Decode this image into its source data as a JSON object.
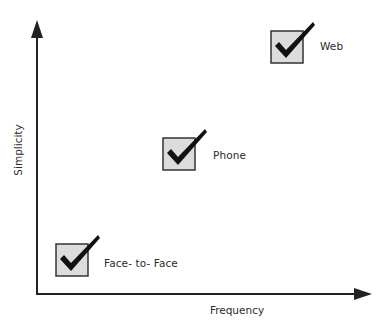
{
  "diagram": {
    "type": "quadrant-scatter",
    "x_axis": {
      "label": "Frequency"
    },
    "y_axis": {
      "label": "Simplicity"
    },
    "colors": {
      "axis": "#222222",
      "box_fill": "#dcdcdc",
      "box_border": "#333333",
      "check": "#111111",
      "text": "#2a2a2a"
    },
    "items": [
      {
        "label": "Face- to- Face",
        "icon": "checkbox-checked-icon"
      },
      {
        "label": "Phone",
        "icon": "checkbox-checked-icon"
      },
      {
        "label": "Web",
        "icon": "checkbox-checked-icon"
      }
    ]
  }
}
